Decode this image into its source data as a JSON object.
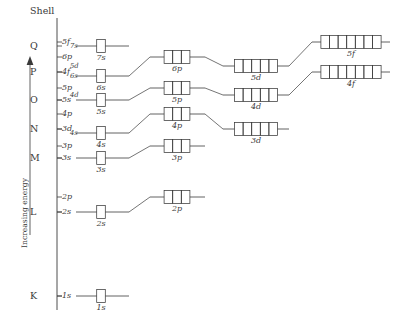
{
  "figure": {
    "axis_title": "Increasing energy",
    "shell_header": "Shell",
    "arrow_icon": "up-arrow-icon",
    "ink_color": "#3a3a3a",
    "background_color": "#ffffff"
  },
  "shells": [
    {
      "letter": "Q",
      "y": 46
    },
    {
      "letter": "P",
      "y": 72
    },
    {
      "letter": "O",
      "y": 100
    },
    {
      "letter": "N",
      "y": 129
    },
    {
      "letter": "M",
      "y": 158
    },
    {
      "letter": "L",
      "y": 212
    },
    {
      "letter": "K",
      "y": 296
    }
  ],
  "axis_ticks": [
    {
      "label": "5f",
      "y": 42,
      "size": "normal"
    },
    {
      "label": "7s",
      "y": 46,
      "size": "small"
    },
    {
      "label": "6p",
      "y": 57,
      "size": "normal"
    },
    {
      "label": "5d",
      "y": 66,
      "size": "small"
    },
    {
      "label": "4f",
      "y": 72,
      "size": "normal"
    },
    {
      "label": "6s",
      "y": 76,
      "size": "small"
    },
    {
      "label": "5p",
      "y": 88,
      "size": "normal"
    },
    {
      "label": "4d",
      "y": 95,
      "size": "small"
    },
    {
      "label": "5s",
      "y": 100,
      "size": "normal"
    },
    {
      "label": "4p",
      "y": 114,
      "size": "normal"
    },
    {
      "label": "3d",
      "y": 129,
      "size": "normal"
    },
    {
      "label": "4s",
      "y": 133,
      "size": "small"
    },
    {
      "label": "3p",
      "y": 146,
      "size": "normal"
    },
    {
      "label": "3s",
      "y": 158,
      "size": "normal"
    },
    {
      "label": "2p",
      "y": 197,
      "size": "normal"
    },
    {
      "label": "2s",
      "y": 212,
      "size": "normal"
    },
    {
      "label": "1s",
      "y": 296,
      "size": "normal"
    }
  ],
  "chart_data": {
    "type": "diagram",
    "ylabel": "Increasing energy",
    "xlabel": "",
    "grid": false,
    "legend": false,
    "subshell_boxes": [
      {
        "label": "7s",
        "type": "s",
        "cells": 1,
        "cx": 101,
        "y": 46,
        "line_x1": 76,
        "line_x2": 129
      },
      {
        "label": "6s",
        "type": "s",
        "cells": 1,
        "cx": 101,
        "y": 76,
        "line_x1": 76,
        "line_x2": 129
      },
      {
        "label": "5s",
        "type": "s",
        "cells": 1,
        "cx": 101,
        "y": 100,
        "line_x1": 76,
        "line_x2": 129
      },
      {
        "label": "4s",
        "type": "s",
        "cells": 1,
        "cx": 101,
        "y": 133,
        "line_x1": 76,
        "line_x2": 129
      },
      {
        "label": "3s",
        "type": "s",
        "cells": 1,
        "cx": 101,
        "y": 158,
        "line_x1": 76,
        "line_x2": 129
      },
      {
        "label": "2s",
        "type": "s",
        "cells": 1,
        "cx": 101,
        "y": 212,
        "line_x1": 76,
        "line_x2": 129
      },
      {
        "label": "1s",
        "type": "s",
        "cells": 1,
        "cx": 101,
        "y": 296,
        "line_x1": 76,
        "line_x2": 129
      },
      {
        "label": "6p",
        "type": "p",
        "cells": 3,
        "cx": 177,
        "y": 57,
        "line_x1": 150,
        "line_x2": 205
      },
      {
        "label": "5p",
        "type": "p",
        "cells": 3,
        "cx": 177,
        "y": 88,
        "line_x1": 150,
        "line_x2": 205
      },
      {
        "label": "4p",
        "type": "p",
        "cells": 3,
        "cx": 177,
        "y": 114,
        "line_x1": 150,
        "line_x2": 205
      },
      {
        "label": "3p",
        "type": "p",
        "cells": 3,
        "cx": 177,
        "y": 146,
        "line_x1": 150,
        "line_x2": 205
      },
      {
        "label": "2p",
        "type": "p",
        "cells": 3,
        "cx": 177,
        "y": 197,
        "line_x1": 150,
        "line_x2": 205
      },
      {
        "label": "5d",
        "type": "d",
        "cells": 5,
        "cx": 256,
        "y": 66,
        "line_x1": 223,
        "line_x2": 289
      },
      {
        "label": "4d",
        "type": "d",
        "cells": 5,
        "cx": 256,
        "y": 95,
        "line_x1": 223,
        "line_x2": 289
      },
      {
        "label": "3d",
        "type": "d",
        "cells": 5,
        "cx": 256,
        "y": 129,
        "line_x1": 223,
        "line_x2": 289
      },
      {
        "label": "5f",
        "type": "f",
        "cells": 7,
        "cx": 351,
        "y": 42,
        "line_x1": 312,
        "line_x2": 390
      },
      {
        "label": "4f",
        "type": "f",
        "cells": 7,
        "cx": 351,
        "y": 72,
        "line_x1": 312,
        "line_x2": 390
      }
    ],
    "connectors": [
      {
        "from": "6s",
        "to": "6p",
        "x1": 129,
        "y1": 76,
        "x2": 150,
        "y2": 57
      },
      {
        "from": "5s",
        "to": "5p",
        "x1": 129,
        "y1": 100,
        "x2": 150,
        "y2": 88
      },
      {
        "from": "4s",
        "to": "4p",
        "x1": 129,
        "y1": 133,
        "x2": 150,
        "y2": 114
      },
      {
        "from": "3s",
        "to": "3p",
        "x1": 129,
        "y1": 158,
        "x2": 150,
        "y2": 146
      },
      {
        "from": "2s",
        "to": "2p",
        "x1": 129,
        "y1": 212,
        "x2": 150,
        "y2": 197
      },
      {
        "from": "6p",
        "to": "5d",
        "x1": 205,
        "y1": 57,
        "x2": 223,
        "y2": 66
      },
      {
        "from": "5p",
        "to": "4d",
        "x1": 205,
        "y1": 88,
        "x2": 223,
        "y2": 95
      },
      {
        "from": "4p",
        "to": "3d",
        "x1": 205,
        "y1": 114,
        "x2": 223,
        "y2": 129
      },
      {
        "from": "5d",
        "to": "5f",
        "x1": 289,
        "y1": 66,
        "x2": 312,
        "y2": 42
      },
      {
        "from": "4d",
        "to": "4f",
        "x1": 289,
        "y1": 95,
        "x2": 312,
        "y2": 72
      }
    ],
    "cell_counts": {
      "s": 1,
      "p": 3,
      "d": 5,
      "f": 7
    }
  }
}
